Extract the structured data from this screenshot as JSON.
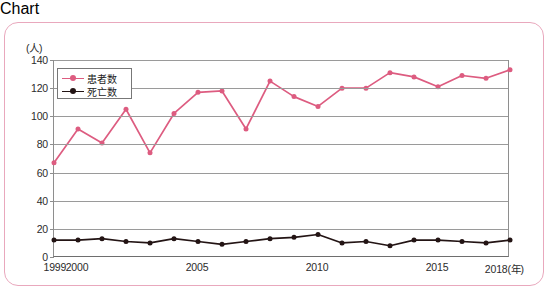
{
  "figure": {
    "frame_color": "#e9a8bd",
    "background": "#ffffff"
  },
  "legend": {
    "position": "inside-top-left",
    "items": [
      {
        "label": "患者数",
        "color": "#dd5c80",
        "marker": "circle"
      },
      {
        "label": "死亡数",
        "color": "#231414",
        "marker": "circle"
      }
    ]
  },
  "axis": {
    "y_unit_label": "(人)",
    "x_unit_label": "(年)",
    "y_ticks": [
      "0",
      "20",
      "40",
      "60",
      "80",
      "100",
      "120",
      "140"
    ],
    "x_ticks": [
      "1999",
      "2000",
      "2005",
      "2010",
      "2015",
      "2018"
    ],
    "x_last_label": "2018(年)"
  },
  "chart_data": {
    "type": "line",
    "title": "",
    "subtitle": "",
    "xlabel": "(年)",
    "ylabel": "(人)",
    "xlim": [
      1999,
      2018
    ],
    "ylim": [
      0,
      140
    ],
    "ytick_step": 20,
    "grid": true,
    "legend_position": "upper left inside",
    "x": [
      1999,
      2000,
      2001,
      2002,
      2003,
      2004,
      2005,
      2006,
      2007,
      2008,
      2009,
      2010,
      2011,
      2012,
      2013,
      2014,
      2015,
      2016,
      2017,
      2018
    ],
    "series": [
      {
        "name": "患者数",
        "color": "#dd5c80",
        "marker": "circle",
        "values": [
          67,
          91,
          81,
          105,
          74,
          102,
          117,
          118,
          91,
          125,
          114,
          107,
          120,
          120,
          131,
          128,
          121,
          129,
          127,
          133
        ]
      },
      {
        "name": "死亡数",
        "color": "#231414",
        "marker": "circle",
        "values": [
          12,
          12,
          13,
          11,
          10,
          13,
          11,
          9,
          11,
          13,
          14,
          16,
          10,
          11,
          8,
          12,
          12,
          11,
          10,
          12
        ]
      }
    ]
  }
}
